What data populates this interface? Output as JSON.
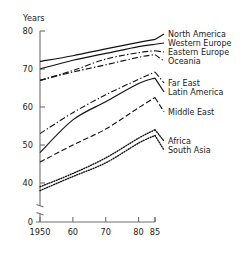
{
  "chart_data": {
    "type": "line",
    "title": "",
    "subtitle": "",
    "xlabel": "",
    "ylabel": "Years",
    "ylabel_position": "top-left",
    "grid": false,
    "legend_position": "right-inline-labels",
    "x": [
      1950,
      1960,
      1970,
      1980,
      1985
    ],
    "xtick_labels": [
      "1950",
      "60",
      "70",
      "80",
      "85"
    ],
    "xlim": [
      1950,
      1985
    ],
    "ytick_labels": [
      "80",
      "70",
      "60",
      "50",
      "40",
      "0"
    ],
    "ytick_values": [
      80,
      70,
      60,
      50,
      40,
      0
    ],
    "ylim": [
      40,
      80
    ],
    "y_axis_break": true,
    "y_axis_break_note": "axis broken between 40 and 0",
    "series": [
      {
        "name": "North America",
        "style": "solid",
        "values": [
          72.0,
          73.5,
          75.3,
          77.0,
          77.8
        ]
      },
      {
        "name": "Western Europe",
        "style": "solid",
        "values": [
          70.0,
          72.3,
          74.1,
          75.9,
          76.5
        ]
      },
      {
        "name": "Eastern Europe",
        "style": "dashdot",
        "values": [
          67.0,
          69.6,
          72.6,
          74.3,
          74.8
        ]
      },
      {
        "name": "Oceania",
        "style": "dashdot",
        "values": [
          67.0,
          69.2,
          71.1,
          73.1,
          73.8
        ]
      },
      {
        "name": "Far East",
        "style": "dashdot",
        "values": [
          53.0,
          58.5,
          63.2,
          67.3,
          69.2
        ]
      },
      {
        "name": "Latin America",
        "style": "solid",
        "values": [
          48.0,
          56.6,
          61.4,
          66.2,
          67.6
        ]
      },
      {
        "name": "Middle East",
        "style": "dashed",
        "values": [
          45.5,
          50.0,
          54.2,
          59.8,
          62.5
        ]
      },
      {
        "name": "Africa",
        "style": "dotted",
        "values": [
          39.0,
          42.5,
          46.6,
          51.8,
          54.0
        ]
      },
      {
        "name": "South Asia",
        "style": "dotted",
        "values": [
          38.0,
          41.7,
          45.3,
          50.5,
          52.5
        ]
      }
    ],
    "legend_groups": [
      {
        "labels": [
          "North America",
          "Western Europe",
          "Eastern Europe",
          "Oceania"
        ]
      },
      {
        "labels": [
          "Far East",
          "Latin America"
        ]
      },
      {
        "labels": [
          "Middle East"
        ]
      },
      {
        "labels": [
          "Africa",
          "South Asia"
        ]
      }
    ]
  }
}
